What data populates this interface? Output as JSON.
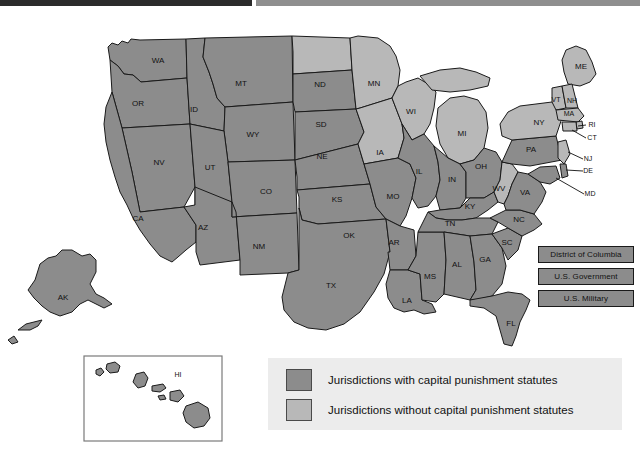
{
  "header": {
    "dark_bar": "",
    "light_bar": ""
  },
  "map": {
    "title": "Jurisdictions with capital punishment statutes",
    "colors": {
      "with_statutes": "#8c8c8c",
      "without_statutes": "#b8b8b8",
      "outline": "#1a1a1a",
      "legend_background": "#ececec"
    },
    "states": [
      {
        "code": "WA",
        "status": "with",
        "x": 158,
        "y": 49
      },
      {
        "code": "OR",
        "status": "with",
        "x": 138,
        "y": 92
      },
      {
        "code": "ID",
        "status": "with",
        "x": 194,
        "y": 98
      },
      {
        "code": "MT",
        "status": "with",
        "x": 241,
        "y": 72
      },
      {
        "code": "WY",
        "status": "with",
        "x": 253,
        "y": 123
      },
      {
        "code": "NV",
        "status": "with",
        "x": 159,
        "y": 151
      },
      {
        "code": "UT",
        "status": "with",
        "x": 210,
        "y": 156
      },
      {
        "code": "CA",
        "status": "with",
        "x": 138,
        "y": 207
      },
      {
        "code": "AZ",
        "status": "with",
        "x": 203,
        "y": 216
      },
      {
        "code": "CO",
        "status": "with",
        "x": 266,
        "y": 180
      },
      {
        "code": "NM",
        "status": "with",
        "x": 259,
        "y": 235
      },
      {
        "code": "ND",
        "status": "without",
        "x": 320,
        "y": 73
      },
      {
        "code": "SD",
        "status": "with",
        "x": 321,
        "y": 113
      },
      {
        "code": "NE",
        "status": "with",
        "x": 322,
        "y": 145
      },
      {
        "code": "KS",
        "status": "with",
        "x": 337,
        "y": 188
      },
      {
        "code": "OK",
        "status": "with",
        "x": 349,
        "y": 224
      },
      {
        "code": "TX",
        "status": "with",
        "x": 331,
        "y": 274
      },
      {
        "code": "MN",
        "status": "without",
        "x": 374,
        "y": 72
      },
      {
        "code": "IA",
        "status": "without",
        "x": 380,
        "y": 141
      },
      {
        "code": "MO",
        "status": "with",
        "x": 393,
        "y": 185
      },
      {
        "code": "AR",
        "status": "with",
        "x": 394,
        "y": 231
      },
      {
        "code": "LA",
        "status": "with",
        "x": 407,
        "y": 289
      },
      {
        "code": "WI",
        "status": "without",
        "x": 411,
        "y": 100
      },
      {
        "code": "IL",
        "status": "with",
        "x": 419,
        "y": 160
      },
      {
        "code": "MS",
        "status": "with",
        "x": 430,
        "y": 265
      },
      {
        "code": "MI",
        "status": "without",
        "x": 462,
        "y": 122
      },
      {
        "code": "IN",
        "status": "with",
        "x": 452,
        "y": 168
      },
      {
        "code": "TN",
        "status": "with",
        "x": 450,
        "y": 212
      },
      {
        "code": "AL",
        "status": "with",
        "x": 457,
        "y": 253
      },
      {
        "code": "KY",
        "status": "with",
        "x": 470,
        "y": 195
      },
      {
        "code": "OH",
        "status": "with",
        "x": 481,
        "y": 155
      },
      {
        "code": "GA",
        "status": "with",
        "x": 485,
        "y": 248
      },
      {
        "code": "FL",
        "status": "with",
        "x": 511,
        "y": 312
      },
      {
        "code": "WV",
        "status": "without",
        "x": 499,
        "y": 177
      },
      {
        "code": "SC",
        "status": "with",
        "x": 507,
        "y": 231
      },
      {
        "code": "NC",
        "status": "with",
        "x": 519,
        "y": 208
      },
      {
        "code": "VA",
        "status": "with",
        "x": 525,
        "y": 181
      },
      {
        "code": "PA",
        "status": "with",
        "x": 531,
        "y": 138
      },
      {
        "code": "NY",
        "status": "without",
        "x": 539,
        "y": 111
      },
      {
        "code": "ME",
        "status": "without",
        "x": 581,
        "y": 55
      },
      {
        "code": "VT",
        "status": "without",
        "x": 556,
        "y": 88
      },
      {
        "code": "NH",
        "status": "without",
        "x": 572,
        "y": 89
      },
      {
        "code": "MA",
        "status": "without",
        "x": 569,
        "y": 102
      },
      {
        "code": "RI",
        "status": "without",
        "x": 592,
        "y": 113
      },
      {
        "code": "CT",
        "status": "without",
        "x": 592,
        "y": 126
      },
      {
        "code": "NJ",
        "status": "without",
        "x": 588,
        "y": 147
      },
      {
        "code": "DE",
        "status": "with",
        "x": 588,
        "y": 159
      },
      {
        "code": "MD",
        "status": "with",
        "x": 590,
        "y": 182
      },
      {
        "code": "AK",
        "status": "with",
        "x": 63,
        "y": 286
      },
      {
        "code": "HI",
        "status": "with",
        "x": 178,
        "y": 363
      }
    ]
  },
  "jurisdiction_chips": [
    {
      "label": "District of Columbia",
      "status": "with"
    },
    {
      "label": "U.S. Government",
      "status": "with"
    },
    {
      "label": "U.S. Military",
      "status": "with"
    }
  ],
  "legend": {
    "items": [
      {
        "swatch": "with",
        "label": "Jurisdictions with capital punishment statutes"
      },
      {
        "swatch": "without",
        "label": "Jurisdictions without capital punishment statutes"
      }
    ]
  }
}
